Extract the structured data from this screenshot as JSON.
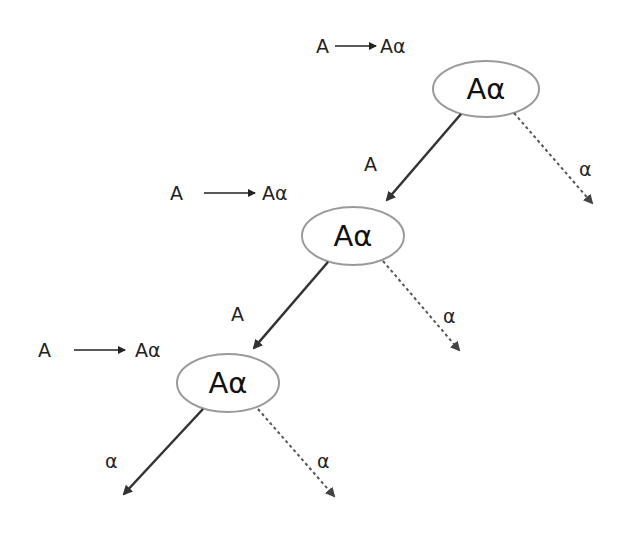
{
  "diagram": {
    "type": "left-recursion-derivation-tree",
    "colors": {
      "ellipse_stroke": "#9a9a9a",
      "solid_edge": "#333333",
      "dashed_edge": "#555555",
      "text": "#1a1a1a"
    },
    "levels": [
      {
        "rule": {
          "lhs": "A",
          "arrow": "⟶",
          "rhs": "Aα"
        },
        "node": {
          "label": "Aα"
        },
        "left_edge": {
          "label": "A",
          "style": "solid"
        },
        "right_edge": {
          "label": "α",
          "style": "dashed"
        }
      },
      {
        "rule": {
          "lhs": "A",
          "arrow": "⟶",
          "rhs": "Aα"
        },
        "node": {
          "label": "Aα"
        },
        "left_edge": {
          "label": "A",
          "style": "solid"
        },
        "right_edge": {
          "label": "α",
          "style": "dashed"
        }
      },
      {
        "rule": {
          "lhs": "A",
          "arrow": "⟶",
          "rhs": "Aα"
        },
        "node": {
          "label": "Aα"
        },
        "left_edge": {
          "label": "A",
          "style": "solid"
        },
        "right_edge": {
          "label": "α",
          "style": "dashed"
        }
      }
    ]
  }
}
